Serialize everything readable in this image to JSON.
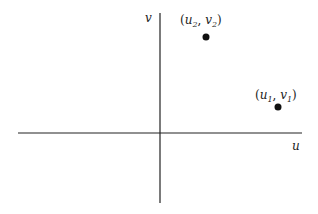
{
  "diagram": {
    "axes": {
      "horizontal_label": "u",
      "vertical_label": "v"
    },
    "points": [
      {
        "name": "u2v2",
        "var1": "u",
        "sub1": "2",
        "var2": "v",
        "sub2": "2",
        "cx": 206,
        "cy": 37
      },
      {
        "name": "u1v1",
        "var1": "u",
        "sub1": "1",
        "var2": "v",
        "sub2": "1",
        "cx": 278,
        "cy": 107
      }
    ],
    "colors": {
      "line": "#222222",
      "point": "#111111"
    }
  }
}
